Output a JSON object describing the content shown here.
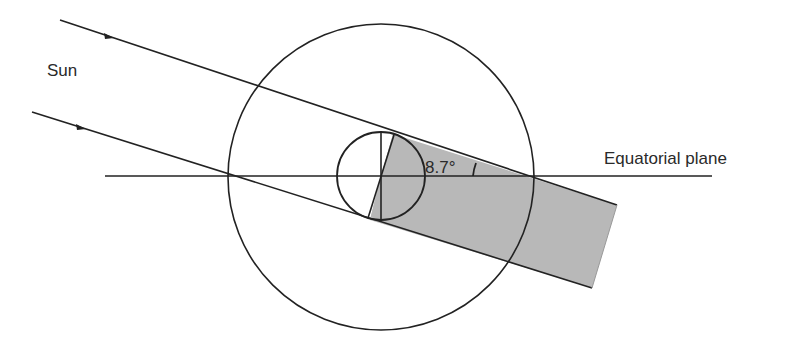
{
  "diagram": {
    "type": "geometry",
    "labels": {
      "sun": "Sun",
      "equatorial_plane": "Equatorial plane",
      "angle": "8.7°"
    },
    "elements": {
      "outer_circle": {
        "cx": 381,
        "cy": 177,
        "r": 153
      },
      "inner_circle": {
        "cx": 381,
        "cy": 176,
        "r": 44
      },
      "equatorial_line": {
        "x1": 105,
        "y1": 176,
        "x2": 712,
        "y2": 176
      },
      "sun_ray_upper": {
        "x1": 60,
        "y1": 20,
        "x2": 617,
        "y2": 205
      },
      "sun_ray_lower": {
        "x1": 32,
        "y1": 112,
        "x2": 592,
        "y2": 288
      },
      "shadow_fill_color": "#b8b8b8",
      "line_color": "#222222"
    }
  }
}
